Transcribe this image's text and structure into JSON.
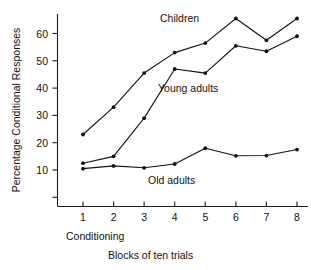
{
  "chart_data": {
    "type": "line",
    "title": "",
    "xlabel": "Blocks of ten trials",
    "ylabel": "Percentage Conditional Responses",
    "x": [
      1,
      2,
      3,
      4,
      5,
      6,
      7,
      8
    ],
    "xtick_labels": [
      "1",
      "2",
      "3",
      "4",
      "5",
      "6",
      "7",
      "8"
    ],
    "ytick_labels": [
      "10",
      "20",
      "30",
      "40",
      "50",
      "60"
    ],
    "ytick_values": [
      10,
      20,
      30,
      40,
      50,
      60
    ],
    "xlim": [
      0.6,
      8.4
    ],
    "ylim": [
      0,
      69
    ],
    "grid": false,
    "legend_position": "inline-annotations",
    "series": [
      {
        "name": "Children",
        "label": "Children",
        "values": [
          23,
          33,
          45.5,
          53,
          56.5,
          65.5,
          57.5,
          65.5
        ]
      },
      {
        "name": "Young adults",
        "label": "Young adults",
        "values": [
          12.5,
          15,
          29,
          47,
          45.5,
          55.5,
          53.5,
          59
        ]
      },
      {
        "name": "Old adults",
        "label": "Old adults",
        "values": [
          10.5,
          11.5,
          10.8,
          12.2,
          18,
          15.2,
          15.3,
          17.5
        ]
      }
    ],
    "annotations": [
      {
        "text": "Children",
        "x": 4.9,
        "y": 67
      },
      {
        "text": "Young adults",
        "x": 4.8,
        "y": 40.5
      },
      {
        "text": "Old adults",
        "x": 3.9,
        "y": 10.0
      },
      {
        "text": "Conditioning",
        "x": 1.0,
        "y": -10.5
      }
    ]
  },
  "labels": {
    "y_axis_title": "Percentage Conditional Responses",
    "x_axis_title": "Blocks of ten trials",
    "conditioning": "Conditioning",
    "children": "Children",
    "young_adults": "Young adults",
    "old_adults": "Old adults"
  },
  "colors": {
    "ink": "#111111",
    "background": "#ffffff"
  }
}
